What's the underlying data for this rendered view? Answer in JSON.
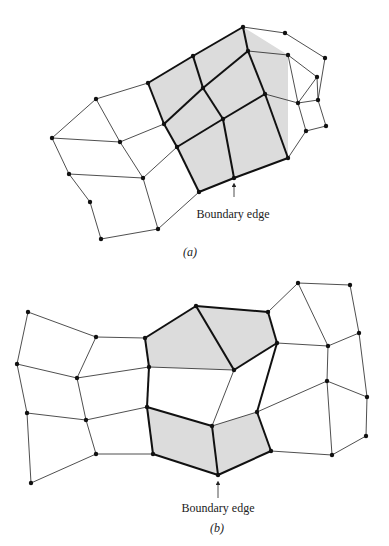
{
  "figure_a": {
    "caption": "(a)",
    "annotation": "Boundary edge",
    "nodes": {
      "A1": [
        243,
        27
      ],
      "A2": [
        285,
        33
      ],
      "A3": [
        193,
        56
      ],
      "A4": [
        248,
        51
      ],
      "A5": [
        288,
        55
      ],
      "A6": [
        325,
        58
      ],
      "A7": [
        148,
        83
      ],
      "A8": [
        203,
        88
      ],
      "A9": [
        317,
        77
      ],
      "A10": [
        265,
        94
      ],
      "A11": [
        298,
        103
      ],
      "A12": [
        318,
        100
      ],
      "A13": [
        164,
        124
      ],
      "A14": [
        223,
        119
      ],
      "A15": [
        306,
        131
      ],
      "A16": [
        326,
        126
      ],
      "A17": [
        177,
        147
      ],
      "A18": [
        288,
        158
      ],
      "A19": [
        234,
        178
      ],
      "A20": [
        199,
        192
      ],
      "L1": [
        96,
        99
      ],
      "L2": [
        52,
        138
      ],
      "L3": [
        120,
        142
      ],
      "L4": [
        69,
        174
      ],
      "L5": [
        143,
        178
      ],
      "L6": [
        90,
        202
      ],
      "L7": [
        158,
        229
      ],
      "L8": [
        101,
        239
      ]
    },
    "shaded": [
      [
        "A7",
        "A1",
        "A5",
        "A18",
        "A19",
        "A20",
        "A17",
        "A13"
      ]
    ],
    "thick_edges": [
      [
        "A7",
        "A3"
      ],
      [
        "A3",
        "A1"
      ],
      [
        "A13",
        "A8"
      ],
      [
        "A8",
        "A4"
      ],
      [
        "A17",
        "A14"
      ],
      [
        "A14",
        "A10"
      ],
      [
        "A20",
        "A19"
      ],
      [
        "A19",
        "A18"
      ],
      [
        "A3",
        "A8"
      ],
      [
        "A8",
        "A14"
      ],
      [
        "A14",
        "A19"
      ],
      [
        "A7",
        "A13"
      ],
      [
        "A13",
        "A17"
      ],
      [
        "A17",
        "A20"
      ],
      [
        "A1",
        "A4"
      ],
      [
        "A4",
        "A10"
      ],
      [
        "A10",
        "A18"
      ]
    ],
    "thin_edges": [
      [
        "A1",
        "A2"
      ],
      [
        "A2",
        "A6"
      ],
      [
        "A6",
        "A12"
      ],
      [
        "A4",
        "A5"
      ],
      [
        "A5",
        "A9"
      ],
      [
        "A9",
        "A12"
      ],
      [
        "A5",
        "A11"
      ],
      [
        "A9",
        "A11"
      ],
      [
        "A10",
        "A11"
      ],
      [
        "A11",
        "A15"
      ],
      [
        "A12",
        "A16"
      ],
      [
        "A11",
        "A12"
      ],
      [
        "A15",
        "A16"
      ],
      [
        "A15",
        "A18"
      ],
      [
        "A7",
        "L1"
      ],
      [
        "L1",
        "L2"
      ],
      [
        "L1",
        "L3"
      ],
      [
        "L2",
        "L4"
      ],
      [
        "L3",
        "A13"
      ],
      [
        "L3",
        "L5"
      ],
      [
        "L4",
        "L5"
      ],
      [
        "L4",
        "L6"
      ],
      [
        "L5",
        "A17"
      ],
      [
        "L5",
        "L7"
      ],
      [
        "L6",
        "L8"
      ],
      [
        "L8",
        "L7"
      ],
      [
        "L7",
        "A20"
      ],
      [
        "L2",
        "L3"
      ]
    ],
    "arrow": {
      "x": 234,
      "y1": 197,
      "y2": 182
    },
    "label_pos": {
      "x": 233,
      "y": 218
    },
    "caption_pos": {
      "x": 190,
      "y": 256
    }
  },
  "figure_b": {
    "caption": "(b)",
    "annotation": "Boundary edge",
    "nodes": {
      "B1": [
        298,
        283
      ],
      "B2": [
        350,
        285
      ],
      "B3": [
        196,
        306
      ],
      "B4": [
        268,
        312
      ],
      "B5": [
        28,
        312
      ],
      "B6": [
        96,
        337
      ],
      "B7": [
        145,
        338
      ],
      "B8": [
        277,
        343
      ],
      "B9": [
        328,
        346
      ],
      "B10": [
        359,
        333
      ],
      "B11": [
        17,
        364
      ],
      "B12": [
        149,
        367
      ],
      "B13": [
        234,
        370
      ],
      "B14": [
        77,
        378
      ],
      "B15": [
        327,
        381
      ],
      "B16": [
        367,
        397
      ],
      "B17": [
        27,
        413
      ],
      "B18": [
        147,
        407
      ],
      "B19": [
        86,
        420
      ],
      "B20": [
        257,
        412
      ],
      "B21": [
        212,
        426
      ],
      "B22": [
        366,
        436
      ],
      "B23": [
        96,
        454
      ],
      "B24": [
        153,
        454
      ],
      "B25": [
        271,
        451
      ],
      "B26": [
        332,
        455
      ],
      "B27": [
        31,
        483
      ],
      "B28": [
        218,
        475
      ]
    },
    "shaded": [
      [
        "B7",
        "B3",
        "B4",
        "B8",
        "B13",
        "B12"
      ],
      [
        "B18",
        "B21",
        "B28",
        "B24"
      ],
      [
        "B21",
        "B20",
        "B25",
        "B28"
      ]
    ],
    "thick_edges": [
      [
        "B7",
        "B3"
      ],
      [
        "B3",
        "B4"
      ],
      [
        "B4",
        "B8"
      ],
      [
        "B8",
        "B13"
      ],
      [
        "B3",
        "B13"
      ],
      [
        "B7",
        "B12"
      ],
      [
        "B12",
        "B18"
      ],
      [
        "B18",
        "B24"
      ],
      [
        "B24",
        "B28"
      ],
      [
        "B28",
        "B25"
      ],
      [
        "B25",
        "B20"
      ],
      [
        "B18",
        "B21"
      ],
      [
        "B21",
        "B28"
      ],
      [
        "B8",
        "B20"
      ]
    ],
    "thin_edges": [
      [
        "B12",
        "B13"
      ],
      [
        "B13",
        "B21"
      ],
      [
        "B21",
        "B20"
      ],
      [
        "B5",
        "B6"
      ],
      [
        "B6",
        "B7"
      ],
      [
        "B5",
        "B11"
      ],
      [
        "B6",
        "B14"
      ],
      [
        "B11",
        "B14"
      ],
      [
        "B14",
        "B12"
      ],
      [
        "B11",
        "B17"
      ],
      [
        "B14",
        "B19"
      ],
      [
        "B17",
        "B19"
      ],
      [
        "B19",
        "B18"
      ],
      [
        "B17",
        "B27"
      ],
      [
        "B19",
        "B23"
      ],
      [
        "B23",
        "B24"
      ],
      [
        "B27",
        "B23"
      ],
      [
        "B4",
        "B1"
      ],
      [
        "B1",
        "B2"
      ],
      [
        "B1",
        "B9"
      ],
      [
        "B2",
        "B10"
      ],
      [
        "B8",
        "B9"
      ],
      [
        "B9",
        "B10"
      ],
      [
        "B9",
        "B15"
      ],
      [
        "B10",
        "B16"
      ],
      [
        "B15",
        "B16"
      ],
      [
        "B20",
        "B15"
      ],
      [
        "B15",
        "B26"
      ],
      [
        "B16",
        "B22"
      ],
      [
        "B22",
        "B26"
      ],
      [
        "B25",
        "B26"
      ]
    ],
    "arrow": {
      "x": 218,
      "y1": 498,
      "y2": 480
    },
    "label_pos": {
      "x": 218,
      "y": 512
    },
    "caption_pos": {
      "x": 217,
      "y": 532
    }
  },
  "style": {
    "shade_color": "#dcdcdc",
    "line_color": "#222222"
  }
}
